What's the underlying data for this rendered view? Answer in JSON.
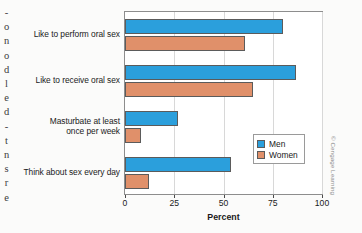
{
  "figure": {
    "credit": "© Cengage Learning"
  },
  "bleed_text": {
    "lines": [
      "-",
      "o",
      "n",
      "o",
      "d",
      "l",
      "e",
      "d",
      "-",
      "t",
      "n",
      "s",
      "r",
      "e"
    ]
  },
  "legend": {
    "position": "inside-right",
    "entries": [
      {
        "label": "Men",
        "color": "#2b9fdc"
      },
      {
        "label": "Women",
        "color": "#e0906a"
      }
    ]
  },
  "chart_data": {
    "type": "bar",
    "orientation": "horizontal",
    "title": "",
    "xlabel": "Percent",
    "ylabel": "",
    "xlim": [
      0,
      100
    ],
    "xticks": [
      0,
      25,
      50,
      75,
      100
    ],
    "xtick_labels": [
      "0",
      "25",
      "50",
      "75",
      "100"
    ],
    "grid": true,
    "grid_axis": "x",
    "legend_position": "inside-right",
    "categories": [
      "Like to perform oral sex",
      "Like to receive oral sex",
      "Masturbate at least\nonce per week",
      "Think about sex every day"
    ],
    "category_lines": [
      [
        "Like to perform oral sex"
      ],
      [
        "Like to receive oral sex"
      ],
      [
        "Masturbate at least",
        "once per week"
      ],
      [
        "Think about sex every day"
      ]
    ],
    "series": [
      {
        "name": "Men",
        "color": "#2b9fdc",
        "values": [
          80,
          87,
          27,
          54
        ]
      },
      {
        "name": "Women",
        "color": "#e0906a",
        "values": [
          61,
          65,
          8,
          12
        ]
      }
    ]
  }
}
